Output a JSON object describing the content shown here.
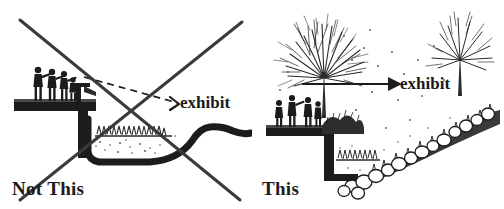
{
  "figure": {
    "type": "comparison-illustration",
    "style": "black-and-white line drawing",
    "background_color": "#ffffff",
    "ink_color": "#1c1c1c",
    "panel_count": 2
  },
  "panels": [
    {
      "id": "not-this",
      "position": "left",
      "caption": "Not This",
      "crossed_out": true,
      "cross_mark": {
        "name": "x-cross-overlay",
        "stroke_color": "#3a3a3a",
        "stroke_width": 3,
        "line_a": [
          20,
          20,
          240,
          200
        ],
        "line_b": [
          20,
          200,
          242,
          22
        ]
      },
      "annotation": {
        "label": "exhibit",
        "leader_style": "dashed",
        "arrowhead": true
      },
      "scene_elements": [
        "viewing-platform",
        "four-visitors",
        "railing-post",
        "dashed-sightline",
        "channelized-stream",
        "grass-tuft",
        "bare-bank"
      ]
    },
    {
      "id": "this",
      "position": "right",
      "caption": "This",
      "crossed_out": false,
      "annotation": {
        "label": "exhibit",
        "leader_style": "solid",
        "arrowhead": true
      },
      "scene_elements": [
        "viewing-platform",
        "four-visitors",
        "large-deciduous-tree",
        "small-deciduous-tree",
        "shrub-mass",
        "boulder-slope",
        "cobbles",
        "grass-tuft",
        "naturalized-stream-bank"
      ]
    }
  ],
  "labels": {
    "exhibit_left": "exhibit",
    "exhibit_right": "exhibit",
    "caption_left": "Not This",
    "caption_right": "This"
  },
  "colors": {
    "ink": "#1c1c1c",
    "ink_soft": "#3a3a3a",
    "ink_light": "#6e6e6e",
    "paper": "#ffffff"
  }
}
